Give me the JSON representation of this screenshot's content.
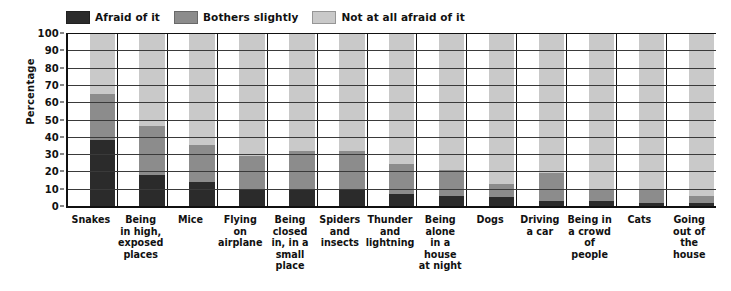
{
  "chart_data": {
    "type": "bar",
    "subtype": "stacked-100-percent-vertical",
    "title": "",
    "xlabel": "",
    "ylabel": "Percentage",
    "ylim": [
      0,
      100
    ],
    "yticks": [
      0,
      10,
      20,
      30,
      40,
      50,
      60,
      70,
      80,
      90,
      100
    ],
    "grid": true,
    "legend_position": "top",
    "categories": [
      "Snakes",
      "Being in high, exposed places",
      "Mice",
      "Flying on airplane",
      "Being closed in, in a small place",
      "Spiders and insects",
      "Thunder and lightning",
      "Being alone in a house at night",
      "Dogs",
      "Driving a car",
      "Being in a crowd of people",
      "Cats",
      "Going out of the house"
    ],
    "category_lines": [
      [
        "Snakes"
      ],
      [
        "Being",
        "in high,",
        "exposed",
        "places"
      ],
      [
        "Mice"
      ],
      [
        "Flying",
        "on",
        "airplane"
      ],
      [
        "Being",
        "closed",
        "in, in a",
        "small",
        "place"
      ],
      [
        "Spiders",
        "and",
        "insects"
      ],
      [
        "Thunder",
        "and",
        "lightning"
      ],
      [
        "Being",
        "alone",
        "in a",
        "house",
        "at night"
      ],
      [
        "Dogs"
      ],
      [
        "Driving",
        "a car"
      ],
      [
        "Being in",
        "a crowd",
        "of people"
      ],
      [
        "Cats"
      ],
      [
        "Going",
        "out of",
        "the house"
      ]
    ],
    "series": [
      {
        "name": "Afraid of it",
        "color": "#2b2b2b",
        "values": [
          38,
          18,
          14,
          10,
          9,
          9,
          7,
          6,
          5,
          3,
          3,
          2,
          2
        ]
      },
      {
        "name": "Bothers slightly",
        "color": "#8c8c8c",
        "values": [
          27,
          28,
          21,
          19,
          23,
          23,
          17,
          15,
          8,
          16,
          6,
          8,
          4
        ]
      },
      {
        "name": "Not at all afraid of it",
        "color": "#c9c9c9",
        "values": [
          35,
          54,
          65,
          71,
          68,
          68,
          76,
          79,
          87,
          81,
          91,
          90,
          94
        ]
      }
    ],
    "cumulative_tops": [
      [
        38,
        65
      ],
      [
        18,
        46
      ],
      [
        14,
        35
      ],
      [
        10,
        29
      ],
      [
        9,
        32
      ],
      [
        9,
        32
      ],
      [
        7,
        24
      ],
      [
        6,
        21
      ],
      [
        5,
        13
      ],
      [
        3,
        19
      ],
      [
        3,
        9
      ],
      [
        2,
        10
      ],
      [
        2,
        6
      ]
    ]
  },
  "legend": {
    "items": [
      {
        "label": "Afraid of it",
        "color": "#2b2b2b"
      },
      {
        "label": "Bothers slightly",
        "color": "#8c8c8c"
      },
      {
        "label": "Not at all afraid of it",
        "color": "#c9c9c9"
      }
    ]
  },
  "axis": {
    "ylabel": "Percentage",
    "yticks": [
      "100",
      "90",
      "80",
      "70",
      "60",
      "50",
      "40",
      "30",
      "20",
      "10",
      "0"
    ]
  }
}
